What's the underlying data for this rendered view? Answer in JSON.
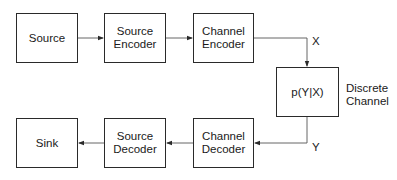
{
  "diagram": {
    "title": "",
    "colors": {
      "stroke": "#2a2a2a",
      "text": "#1a1a1a",
      "background": "#ffffff"
    },
    "nodes": [
      {
        "id": "source",
        "label": "Source"
      },
      {
        "id": "source_encoder",
        "label": "Source\nEncoder"
      },
      {
        "id": "channel_encoder",
        "label": "Channel\nEncoder"
      },
      {
        "id": "channel",
        "label": "p(Y|X)"
      },
      {
        "id": "channel_decoder",
        "label": "Channel\nDecoder"
      },
      {
        "id": "source_decoder",
        "label": "Source\nDecoder"
      },
      {
        "id": "sink",
        "label": "Sink"
      }
    ],
    "edges": [
      {
        "from": "source",
        "to": "source_encoder",
        "label": ""
      },
      {
        "from": "source_encoder",
        "to": "channel_encoder",
        "label": ""
      },
      {
        "from": "channel_encoder",
        "to": "channel",
        "label": "X"
      },
      {
        "from": "channel",
        "to": "channel_decoder",
        "label": "Y"
      },
      {
        "from": "channel_decoder",
        "to": "source_decoder",
        "label": ""
      },
      {
        "from": "source_decoder",
        "to": "sink",
        "label": ""
      }
    ],
    "annotations": {
      "channel_caption": "Discrete\nChannel",
      "x_label": "X",
      "y_label": "Y"
    }
  }
}
